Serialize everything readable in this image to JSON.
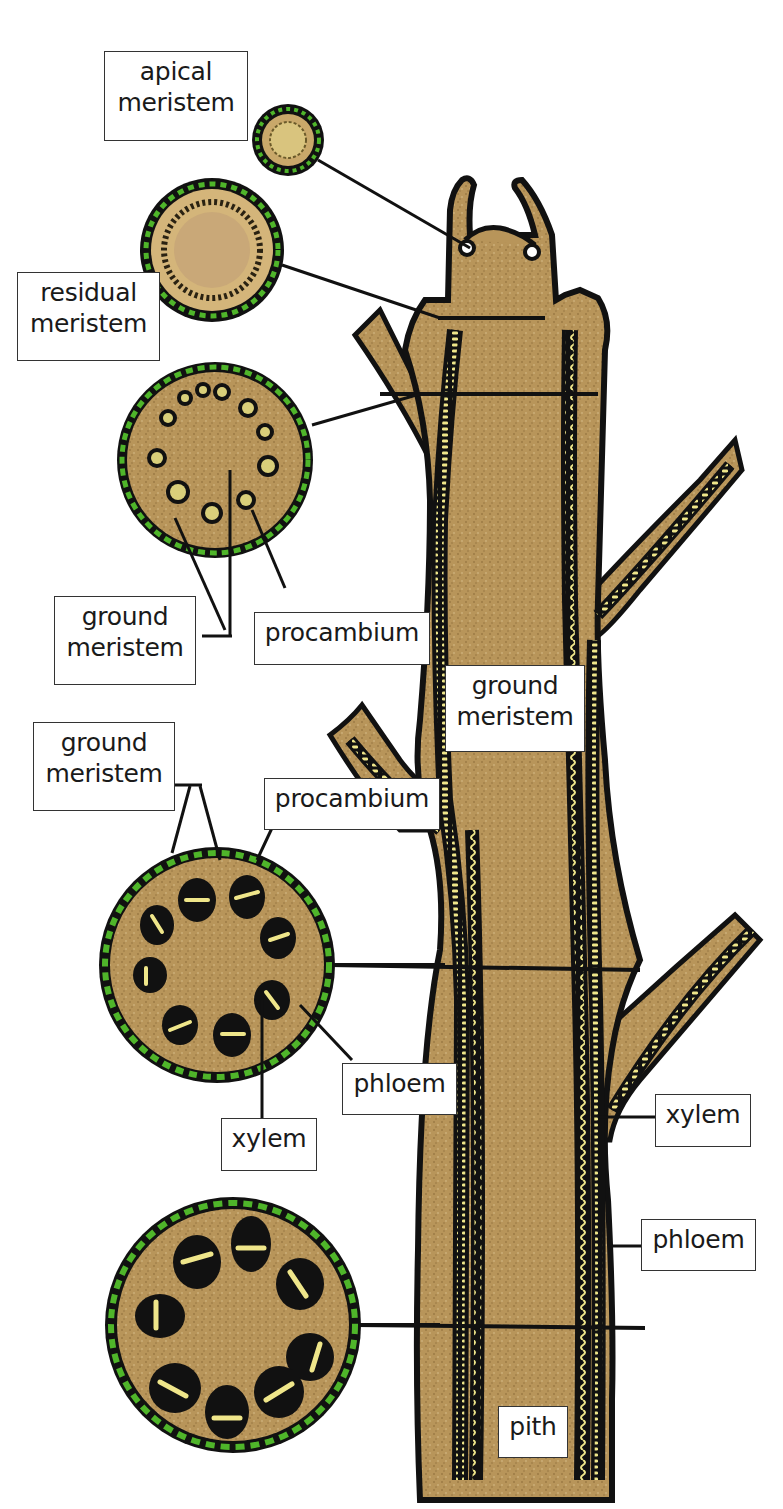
{
  "diagram": {
    "colors": {
      "tissue": "#b8955a",
      "tissue_light": "#d4b57a",
      "outline": "#111111",
      "epidermis_green": "#4fb52a",
      "vascular_yellow": "#efe68a",
      "background": "#ffffff"
    },
    "cross_sections": [
      {
        "id": "cs1",
        "level": "apex",
        "labels": [
          "apical meristem"
        ]
      },
      {
        "id": "cs2",
        "level": "below apex",
        "labels": [
          "residual meristem"
        ]
      },
      {
        "id": "cs3",
        "level": "young stem",
        "labels": [
          "ground meristem",
          "procambium"
        ]
      },
      {
        "id": "cs4",
        "level": "developing stem",
        "labels": [
          "ground meristem",
          "procambium",
          "phloem",
          "xylem"
        ]
      },
      {
        "id": "cs5",
        "level": "mature stem",
        "labels": []
      }
    ],
    "labels": {
      "apical_meristem": "apical\nmeristem",
      "residual_meristem": "residual\nmeristem",
      "ground_meristem_1": "ground\nmeristem",
      "procambium_1": "procambium",
      "ground_meristem_center": "ground\nmeristem",
      "ground_meristem_2": "ground\nmeristem",
      "procambium_2": "procambium",
      "phloem_1": "phloem",
      "xylem_1": "xylem",
      "xylem_2": "xylem",
      "phloem_2": "phloem",
      "pith": "pith"
    }
  }
}
